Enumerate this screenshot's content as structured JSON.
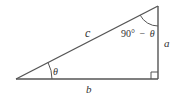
{
  "diagram": {
    "type": "right-triangle",
    "colors": {
      "stroke": "#555555",
      "text": "#333333",
      "background": "#ffffff"
    },
    "vertices": {
      "bottom_left": [
        16,
        79
      ],
      "bottom_right": [
        158,
        79
      ],
      "top_right": [
        158,
        6
      ]
    },
    "labels": {
      "hypotenuse": "c",
      "vertical_side": "a",
      "horizontal_side": "b",
      "angle_bottom_left": "θ",
      "angle_top_right_number": "90°",
      "angle_top_right_op": "−",
      "angle_top_right_var": "θ"
    },
    "right_angle_marker": "square"
  }
}
